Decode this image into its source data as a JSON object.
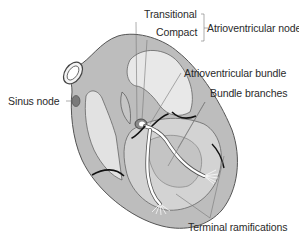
{
  "figure": {
    "labels": {
      "transitional": "Transitional",
      "compact": "Compact",
      "av_node": "Atrioventricular node",
      "sinus_node": "Sinus node",
      "av_bundle": "Atrioventricular bundle",
      "bundle_branches": "Bundle branches",
      "terminal_ramifications": "Terminal ramifications"
    },
    "colors": {
      "wall": "#bdbdbd",
      "chamber": "#e6e6e6",
      "outline": "#555555",
      "conduction_path": "#ffffff",
      "node_dark": "#777777",
      "leader_line": "#777777",
      "text": "#2a2a2a"
    }
  }
}
